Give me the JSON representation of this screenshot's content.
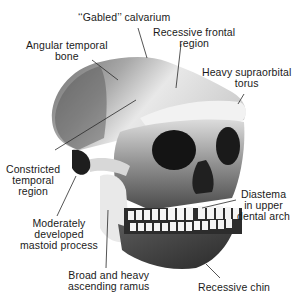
{
  "figure": {
    "labels": [
      {
        "id": "gabled-calvarium",
        "lines": [
          "‘‘Gabled’’ calvarium"
        ]
      },
      {
        "id": "angular-temporal-bone",
        "lines": [
          "Angular temporal",
          "bone"
        ]
      },
      {
        "id": "recessive-frontal-region",
        "lines": [
          "Recessive frontal",
          "region"
        ]
      },
      {
        "id": "heavy-supraorbital-torus",
        "lines": [
          "Heavy supraorbital",
          "torus"
        ]
      },
      {
        "id": "constricted-temporal-region",
        "lines": [
          "Constricted",
          "temporal",
          "region"
        ]
      },
      {
        "id": "diastema",
        "lines": [
          "Diastema",
          "in upper",
          "dental arch"
        ]
      },
      {
        "id": "mastoid-process",
        "lines": [
          "Moderately",
          "developed",
          "mastoid process"
        ]
      },
      {
        "id": "ascending-ramus",
        "lines": [
          "Broad and heavy",
          "ascending ramus"
        ]
      },
      {
        "id": "recessive-chin",
        "lines": [
          "Recessive chin"
        ]
      }
    ],
    "colors": {
      "background": "#ffffff",
      "text": "#1a1a1a",
      "leader_line": "#2a2a2a",
      "bone_light": "#e6e6e6",
      "bone_mid": "#9a9a9a",
      "bone_dark": "#3a3a3a",
      "orbit": "#111111"
    }
  }
}
